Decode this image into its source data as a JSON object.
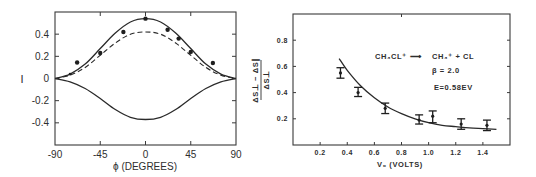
{
  "chart_data": [
    {
      "type": "line",
      "title": "",
      "xlabel": "ϕ (DEGREES)",
      "ylabel": "I",
      "xlim": [
        -90,
        90
      ],
      "ylim": [
        -0.6,
        0.6
      ],
      "xticks": [
        -90,
        -45,
        0,
        45,
        90
      ],
      "xtick_labels": [
        "-90",
        "-45",
        "0",
        "45",
        "90"
      ],
      "yticks": [
        0.4,
        0.2,
        0,
        -0.2,
        -0.4
      ],
      "ytick_labels": [
        "0.4",
        "0.2",
        "0",
        "-0.2",
        "-0.4"
      ],
      "grid": false,
      "series": [
        {
          "name": "upper solid curve",
          "style": "solid",
          "peak": 0.54,
          "x": [
            -90,
            -75,
            -60,
            -45,
            -30,
            -15,
            0,
            15,
            30,
            45,
            60,
            75,
            90
          ],
          "y": [
            0,
            0.04,
            0.13,
            0.27,
            0.41,
            0.51,
            0.54,
            0.51,
            0.41,
            0.27,
            0.13,
            0.04,
            0
          ]
        },
        {
          "name": "dashed curve",
          "style": "dashed",
          "peak": 0.42,
          "x": [
            -90,
            -75,
            -60,
            -45,
            -30,
            -15,
            0,
            15,
            30,
            45,
            60,
            75,
            90
          ],
          "y": [
            0,
            0.03,
            0.1,
            0.21,
            0.32,
            0.4,
            0.42,
            0.4,
            0.32,
            0.21,
            0.1,
            0.03,
            0
          ]
        },
        {
          "name": "lower solid curve",
          "style": "solid",
          "peak": -0.37,
          "x": [
            -90,
            -75,
            -60,
            -45,
            -30,
            -15,
            0,
            15,
            30,
            45,
            60,
            75,
            90
          ],
          "y": [
            0,
            -0.03,
            -0.09,
            -0.18,
            -0.28,
            -0.35,
            -0.37,
            -0.35,
            -0.28,
            -0.18,
            -0.09,
            -0.03,
            0
          ]
        },
        {
          "name": "measured points",
          "style": "scatter",
          "x": [
            -75,
            -68,
            -45,
            -22,
            0,
            22,
            33,
            45,
            67
          ],
          "y": [
            0.04,
            0.145,
            0.23,
            0.42,
            0.54,
            0.44,
            0.36,
            0.24,
            0.14
          ]
        }
      ]
    },
    {
      "type": "scatter",
      "title": "",
      "xlabel": "V₀ (VOLTS)",
      "ylabel_numerator": "ΔS⊥ − ΔS∥",
      "ylabel_denominator": "ΔS⊥",
      "xlim": [
        0,
        1.6
      ],
      "ylim": [
        0,
        1.0
      ],
      "xticks": [
        0.2,
        0.4,
        0.6,
        0.8,
        1.0,
        1.2,
        1.4
      ],
      "xtick_labels": [
        "0.2",
        "0.4",
        "0.6",
        "0.8",
        "1.0",
        "1.2",
        "1.4"
      ],
      "yticks": [
        0.8,
        0.6,
        0.4,
        0.2
      ],
      "ytick_labels": [
        "0.8",
        "0.6",
        "0.4",
        "0.2"
      ],
      "grid": false,
      "annotations": {
        "reaction_lhs": "CH₃CL⁺",
        "reaction_arrow": "⟶",
        "reaction_rhs": "CH₃⁺ + CL",
        "beta": "β = 2.0",
        "energy": "E=0.58EV"
      },
      "series": [
        {
          "name": "measured",
          "x": [
            0.35,
            0.48,
            0.68,
            0.93,
            1.03,
            1.24,
            1.43
          ],
          "y": [
            0.55,
            0.4,
            0.28,
            0.19,
            0.22,
            0.16,
            0.15
          ],
          "err_low": [
            0.51,
            0.37,
            0.24,
            0.16,
            0.17,
            0.12,
            0.11
          ],
          "err_high": [
            0.59,
            0.44,
            0.32,
            0.23,
            0.26,
            0.2,
            0.19
          ]
        },
        {
          "name": "theory curve",
          "style": "solid",
          "x": [
            0.34,
            0.4,
            0.5,
            0.6,
            0.7,
            0.8,
            0.9,
            1.0,
            1.1,
            1.2,
            1.3,
            1.4,
            1.5
          ],
          "y": [
            0.66,
            0.57,
            0.45,
            0.36,
            0.29,
            0.24,
            0.2,
            0.17,
            0.15,
            0.14,
            0.13,
            0.125,
            0.12
          ]
        }
      ]
    }
  ]
}
